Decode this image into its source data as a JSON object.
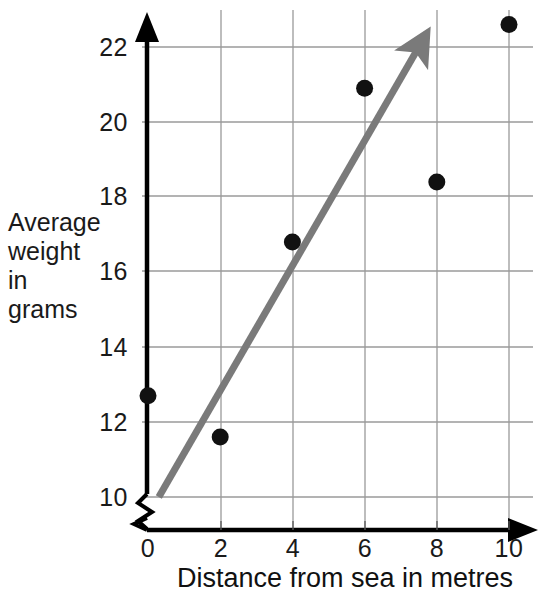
{
  "chart_data": {
    "type": "scatter",
    "title": "",
    "xlabel": "Distance from sea in metres",
    "ylabel_lines": [
      "Average",
      "weight",
      "in",
      "grams"
    ],
    "ylabel": "Average weight in grams",
    "x": [
      0,
      2,
      4,
      6,
      8,
      10
    ],
    "values": [
      12.7,
      11.6,
      16.8,
      20.9,
      18.4,
      22.6
    ],
    "points": [
      {
        "x": 0,
        "y": 12.7
      },
      {
        "x": 2,
        "y": 11.6
      },
      {
        "x": 4,
        "y": 16.8
      },
      {
        "x": 6,
        "y": 20.9
      },
      {
        "x": 8,
        "y": 18.4
      },
      {
        "x": 10,
        "y": 22.6
      }
    ],
    "xlim": [
      0,
      10
    ],
    "ylim": [
      10,
      22.8
    ],
    "xticks": [
      "0",
      "2",
      "4",
      "6",
      "8",
      "10"
    ],
    "yticks": [
      "10",
      "12",
      "14",
      "16",
      "18",
      "20",
      "22"
    ],
    "grid": true,
    "legend": "none",
    "y_axis_break": true,
    "trend_line": {
      "name": "line of best fit",
      "x_start": 0.3,
      "y_start": 10.0,
      "x_end": 7.5,
      "y_end": 22.0,
      "arrow": "end",
      "color": "#7a7a7a"
    },
    "colors": {
      "point": "#111111",
      "axis": "#000000",
      "grid": "#9a9a9a",
      "trend": "#7a7a7a"
    }
  }
}
